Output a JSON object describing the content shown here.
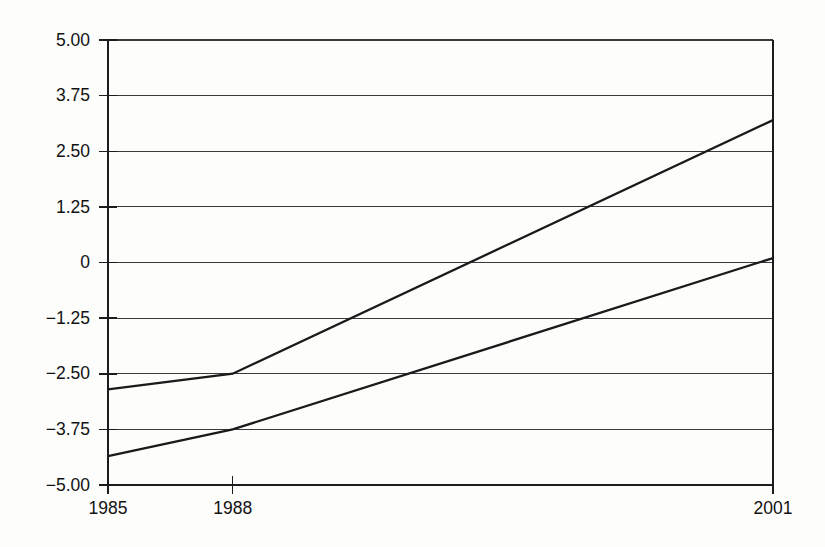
{
  "chart_data": {
    "type": "line",
    "title": "",
    "subtitle": "",
    "xlabel": "",
    "ylabel": "",
    "x": [
      1985,
      1988,
      2001
    ],
    "x_tick_labels": [
      "1985",
      "1988",
      "2001"
    ],
    "y_tick_labels": [
      "5.00",
      "3.75",
      "2.50",
      "1.25",
      "0",
      "−1.25",
      "−2.50",
      "−3.75",
      "−5.00"
    ],
    "y_tick_values": [
      5.0,
      3.75,
      2.5,
      1.25,
      0,
      -1.25,
      -2.5,
      -3.75,
      -5.0
    ],
    "xlim": [
      1985,
      2001
    ],
    "ylim": [
      -5.0,
      5.0
    ],
    "grid": true,
    "grid_axis": "y",
    "legend": false,
    "legend_position": "none",
    "series": [
      {
        "name": "upper-series",
        "values": [
          -2.85,
          -2.5,
          3.2
        ],
        "color": "#1a1a1a"
      },
      {
        "name": "lower-series",
        "values": [
          -4.35,
          -3.75,
          0.1
        ],
        "color": "#1a1a1a"
      }
    ]
  },
  "figure": {
    "background_color": "#fdfdfc",
    "axis_color": "#1c1c1c",
    "grid_color": "#3a3a3a"
  }
}
